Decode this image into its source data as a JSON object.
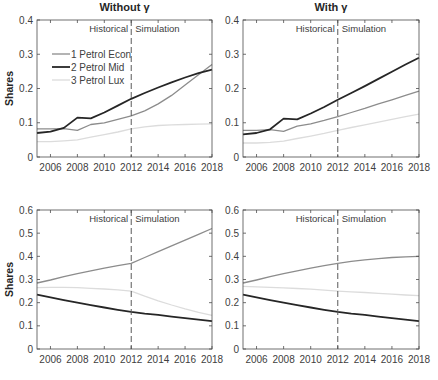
{
  "figure": {
    "colors": {
      "econ": "#8c8c8c",
      "mid": "#262626",
      "lux": "#dcdcdc",
      "axis": "#262626",
      "divider": "#595959"
    },
    "ylabel": "Shares",
    "region_labels": {
      "historical": "Historical",
      "simulation": "Simulation"
    },
    "legend": [
      "1 Petrol Econ",
      "2 Petrol Mid",
      "3 Petrol Lux"
    ]
  },
  "chart_data": [
    {
      "type": "line",
      "title": "Without γ",
      "xlabel": "",
      "ylabel": "Shares",
      "xlim": [
        2005,
        2018
      ],
      "ylim": [
        0,
        0.4
      ],
      "xticks": [
        2006,
        2008,
        2010,
        2012,
        2014,
        2016,
        2018
      ],
      "yticks": [
        0,
        0.1,
        0.2,
        0.3,
        0.4
      ],
      "ytick_labels": [
        "0",
        "0.1",
        "0.2",
        "0.3",
        "0.4"
      ],
      "divider_x": 2012,
      "legend": true,
      "legend_position": "upper-left",
      "x": [
        2005,
        2006,
        2007,
        2008,
        2009,
        2010,
        2011,
        2012,
        2013,
        2014,
        2015,
        2016,
        2017,
        2018
      ],
      "series": [
        {
          "name": "1 Petrol Econ",
          "values": [
            0.082,
            0.082,
            0.083,
            0.078,
            0.095,
            0.1,
            0.11,
            0.12,
            0.135,
            0.155,
            0.18,
            0.21,
            0.24,
            0.27
          ]
        },
        {
          "name": "2 Petrol Mid",
          "values": [
            0.07,
            0.074,
            0.085,
            0.115,
            0.113,
            0.13,
            0.15,
            0.17,
            0.187,
            0.203,
            0.218,
            0.232,
            0.245,
            0.255
          ]
        },
        {
          "name": "3 Petrol Lux",
          "values": [
            0.045,
            0.045,
            0.047,
            0.05,
            0.058,
            0.065,
            0.073,
            0.082,
            0.088,
            0.092,
            0.094,
            0.095,
            0.096,
            0.097
          ]
        }
      ]
    },
    {
      "type": "line",
      "title": "With γ",
      "xlabel": "",
      "ylabel": "",
      "xlim": [
        2005,
        2018
      ],
      "ylim": [
        0,
        0.4
      ],
      "xticks": [
        2006,
        2008,
        2010,
        2012,
        2014,
        2016,
        2018
      ],
      "yticks": [
        0,
        0.1,
        0.2,
        0.3,
        0.4
      ],
      "ytick_labels": [
        "0",
        "0.1",
        "0.2",
        "0.3",
        "0.4"
      ],
      "divider_x": 2012,
      "legend": false,
      "x": [
        2005,
        2006,
        2007,
        2008,
        2009,
        2010,
        2011,
        2012,
        2013,
        2014,
        2015,
        2016,
        2017,
        2018
      ],
      "series": [
        {
          "name": "1 Petrol Econ",
          "values": [
            0.078,
            0.078,
            0.08,
            0.075,
            0.09,
            0.097,
            0.107,
            0.118,
            0.13,
            0.142,
            0.155,
            0.167,
            0.18,
            0.192
          ]
        },
        {
          "name": "2 Petrol Mid",
          "values": [
            0.066,
            0.07,
            0.081,
            0.112,
            0.11,
            0.127,
            0.146,
            0.167,
            0.187,
            0.207,
            0.228,
            0.249,
            0.27,
            0.29
          ]
        },
        {
          "name": "3 Petrol Lux",
          "values": [
            0.041,
            0.041,
            0.043,
            0.046,
            0.054,
            0.061,
            0.069,
            0.078,
            0.086,
            0.094,
            0.102,
            0.11,
            0.118,
            0.125
          ]
        }
      ]
    },
    {
      "type": "line",
      "title": "",
      "xlabel": "",
      "ylabel": "Shares",
      "xlim": [
        2005,
        2018
      ],
      "ylim": [
        0,
        0.6
      ],
      "xticks": [
        2006,
        2008,
        2010,
        2012,
        2014,
        2016,
        2018
      ],
      "yticks": [
        0,
        0.1,
        0.2,
        0.3,
        0.4,
        0.5,
        0.6
      ],
      "ytick_labels": [
        "0",
        "0.1",
        "0.2",
        "0.3",
        "0.4",
        "0.5",
        "0.6"
      ],
      "divider_x": 2012,
      "legend": false,
      "x": [
        2005,
        2006,
        2007,
        2008,
        2009,
        2010,
        2011,
        2012,
        2013,
        2014,
        2015,
        2016,
        2017,
        2018
      ],
      "series": [
        {
          "name": "1 Petrol Econ",
          "values": [
            0.285,
            0.298,
            0.312,
            0.325,
            0.337,
            0.349,
            0.36,
            0.37,
            0.395,
            0.42,
            0.445,
            0.47,
            0.495,
            0.52
          ]
        },
        {
          "name": "2 Petrol Mid",
          "values": [
            0.235,
            0.223,
            0.211,
            0.2,
            0.189,
            0.179,
            0.169,
            0.16,
            0.153,
            0.147,
            0.14,
            0.133,
            0.127,
            0.12
          ]
        },
        {
          "name": "3 Petrol Lux",
          "values": [
            0.265,
            0.266,
            0.266,
            0.265,
            0.262,
            0.259,
            0.255,
            0.25,
            0.228,
            0.208,
            0.19,
            0.173,
            0.158,
            0.145
          ]
        }
      ]
    },
    {
      "type": "line",
      "title": "",
      "xlabel": "",
      "ylabel": "",
      "xlim": [
        2005,
        2018
      ],
      "ylim": [
        0,
        0.6
      ],
      "xticks": [
        2006,
        2008,
        2010,
        2012,
        2014,
        2016,
        2018
      ],
      "yticks": [
        0,
        0.1,
        0.2,
        0.3,
        0.4,
        0.5,
        0.6
      ],
      "ytick_labels": [
        "0",
        "0.1",
        "0.2",
        "0.3",
        "0.4",
        "0.5",
        "0.6"
      ],
      "divider_x": 2012,
      "legend": false,
      "x": [
        2005,
        2006,
        2007,
        2008,
        2009,
        2010,
        2011,
        2012,
        2013,
        2014,
        2015,
        2016,
        2017,
        2018
      ],
      "series": [
        {
          "name": "1 Petrol Econ",
          "values": [
            0.285,
            0.298,
            0.312,
            0.325,
            0.337,
            0.349,
            0.36,
            0.37,
            0.378,
            0.385,
            0.39,
            0.395,
            0.398,
            0.4
          ]
        },
        {
          "name": "2 Petrol Mid",
          "values": [
            0.235,
            0.223,
            0.211,
            0.2,
            0.189,
            0.179,
            0.169,
            0.16,
            0.153,
            0.147,
            0.14,
            0.133,
            0.127,
            0.12
          ]
        },
        {
          "name": "3 Petrol Lux",
          "values": [
            0.27,
            0.268,
            0.266,
            0.264,
            0.261,
            0.258,
            0.254,
            0.25,
            0.247,
            0.244,
            0.24,
            0.237,
            0.233,
            0.23
          ]
        }
      ]
    }
  ]
}
